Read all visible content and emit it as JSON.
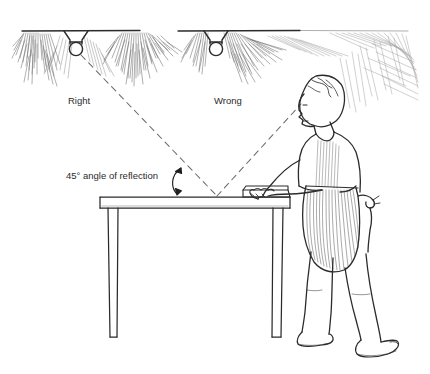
{
  "illustration": {
    "title": "45 degree angle of reflection diagram",
    "kind": "line-drawing",
    "ink_color": "#2b2b2b",
    "background_color": "#ffffff",
    "labels": {
      "right": "Right",
      "wrong": "Wrong",
      "angle": "45° angle of reflection"
    },
    "elements": {
      "ceiling": "ceiling-line",
      "lamp_left": "ceiling-lamp-icon",
      "lamp_right": "ceiling-lamp-icon",
      "glare_left": "light-glare-hatching",
      "glare_right": "light-glare-hatching",
      "incident_ray": "dashed-incident-light-ray",
      "reflected_ray": "dashed-reflected-light-ray",
      "angle_arc": "double-headed-angle-arrow",
      "table": "workbench-table",
      "person": "standing-worker-figure",
      "apron": "striped-apron"
    }
  }
}
